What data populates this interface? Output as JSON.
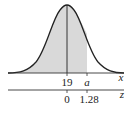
{
  "diagram": {
    "type": "normal-distribution-curve",
    "x_axis": {
      "label": "x",
      "mean_label": "19",
      "marker_label": "a"
    },
    "z_axis": {
      "label": "z",
      "mean_label": "0",
      "marker_label": "1.28"
    },
    "shaded_region": "left of a (z = 1.28)",
    "colors": {
      "curve": "#222222",
      "shade": "#d9d9d9",
      "axis": "#333333"
    }
  }
}
